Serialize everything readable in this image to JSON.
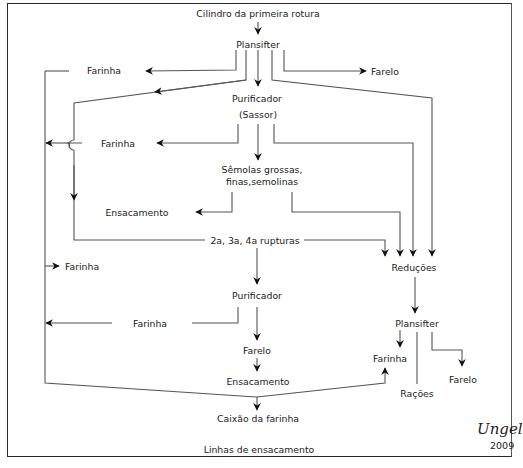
{
  "diagram": {
    "title": "Cilindro da primeira rotura",
    "nodes": {
      "cilindro": "Cilindro da primeira rotura",
      "plansifter1": "Plansifter",
      "farinha1": "Farinha",
      "farelo1": "Farelo",
      "purificador1_l1": "Purificador",
      "purificador1_l2": "(Sassor)",
      "farinha2": "Farinha",
      "semolas_l1": "Sêmolas grossas,",
      "semolas_l2": "finas,semolinas",
      "ensacamento1": "Ensacamento",
      "rupturas": "2a, 3a, 4a rupturas",
      "farinha3": "Farinha",
      "reducoes": "Reduções",
      "purificador2": "Purificador",
      "farinha4": "Farinha",
      "plansifter2": "Plansifter",
      "farelo2": "Farelo",
      "farinha5": "Farinha",
      "ensacamento2": "Ensacamento",
      "racoes": "Rações",
      "farelo3": "Farelo",
      "caixao": "Caixão da farinha",
      "linhas": "Linhas de ensacamento"
    },
    "signature": {
      "name": "Ungel",
      "year": "2009"
    },
    "edges": [
      [
        "Cilindro da primeira rotura",
        "Plansifter"
      ],
      [
        "Plansifter",
        "Farinha"
      ],
      [
        "Plansifter",
        "Farelo"
      ],
      [
        "Plansifter",
        "Purificador (Sassor)"
      ],
      [
        "Plansifter",
        "2a, 3a, 4a rupturas"
      ],
      [
        "Plansifter",
        "Reduções"
      ],
      [
        "Purificador (Sassor)",
        "Farinha"
      ],
      [
        "Purificador (Sassor)",
        "Sêmolas grossas, finas,semolinas"
      ],
      [
        "Purificador (Sassor)",
        "Reduções"
      ],
      [
        "Sêmolas grossas, finas,semolinas",
        "Ensacamento"
      ],
      [
        "Sêmolas grossas, finas,semolinas",
        "Reduções"
      ],
      [
        "2a, 3a, 4a rupturas",
        "Purificador"
      ],
      [
        "2a, 3a, 4a rupturas",
        "Reduções"
      ],
      [
        "Purificador",
        "Farinha"
      ],
      [
        "Purificador",
        "Farelo"
      ],
      [
        "Farelo",
        "Ensacamento"
      ],
      [
        "Reduções",
        "Plansifter"
      ],
      [
        "Plansifter",
        "Farinha"
      ],
      [
        "Plansifter",
        "Rações"
      ],
      [
        "Plansifter",
        "Farelo"
      ],
      [
        "Farinha (collector)",
        "Caixão da farinha"
      ],
      [
        "Farinha (collector)",
        "Farinha (Plansifter 2)"
      ]
    ]
  }
}
